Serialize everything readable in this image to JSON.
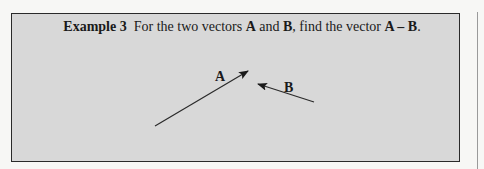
{
  "example": {
    "label": "Example 3",
    "text_pre": "For the two vectors ",
    "vec_a": "A",
    "text_and": " and ",
    "vec_b": "B",
    "text_mid": ", find the vector ",
    "expr": "A – B",
    "text_end": "."
  },
  "figure": {
    "vector_a": {
      "label": "A",
      "from": [
        155,
        126
      ],
      "to": [
        248,
        71
      ]
    },
    "vector_b": {
      "label": "B",
      "from": [
        314,
        102
      ],
      "to": [
        258,
        84
      ]
    }
  },
  "colors": {
    "box_fill": "#d8d8d8",
    "border": "#2a2a2a",
    "ink": "#1a1a1a"
  }
}
